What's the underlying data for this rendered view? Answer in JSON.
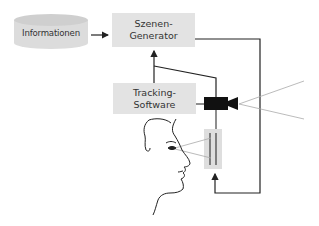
{
  "diagram": {
    "nodes": {
      "informationen": {
        "label": "Informationen",
        "shape": "cylinder"
      },
      "szenen_generator": {
        "label": "Szenen-\nGenerator",
        "shape": "box"
      },
      "tracking_software": {
        "label": "Tracking-\nSoftware",
        "shape": "box"
      },
      "camera": {
        "label": "",
        "shape": "video-camera-icon"
      },
      "display": {
        "label": "",
        "shape": "display-panel"
      },
      "user": {
        "label": "",
        "shape": "face-profile"
      }
    },
    "edges": [
      {
        "from": "informationen",
        "to": "szenen_generator"
      },
      {
        "from": "tracking_software",
        "to": "szenen_generator"
      },
      {
        "from": "camera",
        "to": "tracking_software"
      },
      {
        "from": "szenen_generator",
        "to": "display"
      }
    ],
    "colors": {
      "box_fill": "#e3e3e3",
      "line": "#333333",
      "camera": "#111111",
      "sight_lines": "#aaaaaa"
    }
  }
}
